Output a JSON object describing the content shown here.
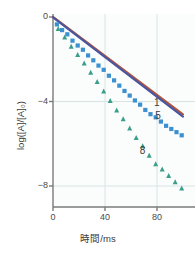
{
  "chart_data": {
    "type": "scatter",
    "title": "",
    "xlabel": "時間/ms",
    "ylabel": "log([A]/[A]₀)",
    "xlim": [
      0,
      100
    ],
    "ylim": [
      -9.2,
      0.3
    ],
    "xticks": [
      "0",
      "40",
      "80"
    ],
    "xtick_values": [
      0,
      40,
      80
    ],
    "yticks": [
      "0",
      "−4",
      "−8"
    ],
    "ytick_values": [
      0,
      -4,
      -8
    ],
    "grid": true,
    "legend_position": "inline-annotations",
    "background_color": "#fbfdfd",
    "grid_color": "#d8e4e4",
    "axis_color": "#7a7a7a",
    "series": [
      {
        "name": "1",
        "label": "1",
        "marker": "line",
        "style": "solid-line",
        "color": "#b0563c",
        "secondary_color": "#4a55a0",
        "label_x": 80,
        "label_y": -4.05,
        "slope": -0.047,
        "x": [
          0,
          100
        ],
        "values": [
          0,
          -4.7
        ]
      },
      {
        "name": "5",
        "label": "5",
        "marker": "square",
        "color": "#3d90d0",
        "label_x": 81,
        "label_y": -4.7,
        "x": [
          3,
          7,
          11,
          15,
          19,
          23,
          27,
          31,
          35,
          39,
          43,
          47,
          51,
          55,
          59,
          63,
          67,
          71,
          75,
          79,
          83,
          87,
          91,
          95,
          99
        ],
        "values": [
          -0.35,
          -0.62,
          -0.82,
          -1.12,
          -1.35,
          -1.55,
          -1.82,
          -2.05,
          -2.3,
          -2.5,
          -2.78,
          -3.0,
          -3.25,
          -3.5,
          -3.72,
          -3.95,
          -4.15,
          -4.4,
          -4.6,
          -4.75,
          -4.95,
          -5.15,
          -5.3,
          -5.45,
          -5.6
        ]
      },
      {
        "name": "8",
        "label": "8",
        "marker": "triangle",
        "color": "#3a9e8a",
        "label_x": 69,
        "label_y": -6.35,
        "x": [
          4,
          9,
          14,
          19,
          24,
          29,
          34,
          39,
          44,
          49,
          54,
          59,
          64,
          69,
          74,
          79,
          84,
          89,
          94,
          99
        ],
        "values": [
          -0.55,
          -0.95,
          -1.38,
          -1.78,
          -2.18,
          -2.62,
          -3.05,
          -3.5,
          -3.95,
          -4.4,
          -4.82,
          -5.25,
          -5.7,
          -6.1,
          -6.55,
          -6.95,
          -7.2,
          -7.5,
          -7.8,
          -8.1
        ]
      }
    ]
  },
  "axis": {
    "x_title": "時間/ms",
    "y_title": "log([A]/[A]₀)",
    "x_tick_labels": [
      "0",
      "40",
      "80"
    ],
    "y_tick_labels": [
      "0",
      "−4",
      "−8"
    ]
  },
  "annotations": {
    "series_1": "1",
    "series_5": "5",
    "series_8": "8"
  }
}
